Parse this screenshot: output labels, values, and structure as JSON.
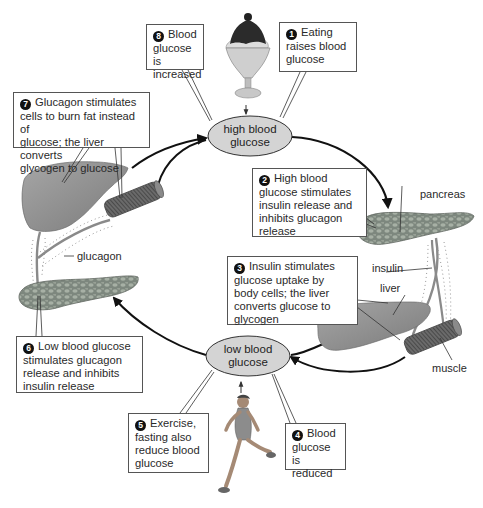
{
  "states": {
    "high": {
      "line1": "high blood",
      "line2": "glucose"
    },
    "low": {
      "line1": "low blood",
      "line2": "glucose"
    }
  },
  "steps": [
    {
      "number": "1",
      "text": [
        "Eating",
        "raises blood",
        "glucose"
      ]
    },
    {
      "number": "2",
      "text": [
        "High blood",
        "glucose stimulates",
        "insulin release and",
        "inhibits glucagon",
        "release"
      ]
    },
    {
      "number": "3",
      "text": [
        "Insulin stimulates",
        "glucose uptake by",
        "body cells; the liver",
        "converts glucose to",
        "glycogen"
      ]
    },
    {
      "number": "4",
      "text": [
        "Blood",
        "glucose is",
        "reduced"
      ]
    },
    {
      "number": "5",
      "text": [
        "Exercise,",
        "fasting also",
        "reduce blood",
        "glucose"
      ]
    },
    {
      "number": "6",
      "text": [
        "Low blood glucose",
        "stimulates glucagon",
        "release and inhibits",
        "insulin release"
      ]
    },
    {
      "number": "7",
      "text": [
        "Glucagon stimulates",
        "cells to burn fat instead of",
        "glucose; the liver converts",
        "glycogen to glucose"
      ]
    },
    {
      "number": "8",
      "text": [
        "Blood",
        "glucose is",
        "increased"
      ]
    }
  ],
  "labels": {
    "pancreas": "pancreas",
    "insulin": "insulin",
    "liver": "liver",
    "muscle": "muscle",
    "glucagon": "glucagon"
  },
  "icons": [
    "ice-cream-sundae-icon",
    "runner-icon",
    "liver-icon",
    "pancreas-icon",
    "muscle-icon"
  ],
  "colors": {
    "ellipse_fill": "#d4d4d4",
    "organ_fill": "#8c8c8c",
    "pancreas_fill": "#7f8a80",
    "arrow": "#111111",
    "box_border": "#555555"
  }
}
